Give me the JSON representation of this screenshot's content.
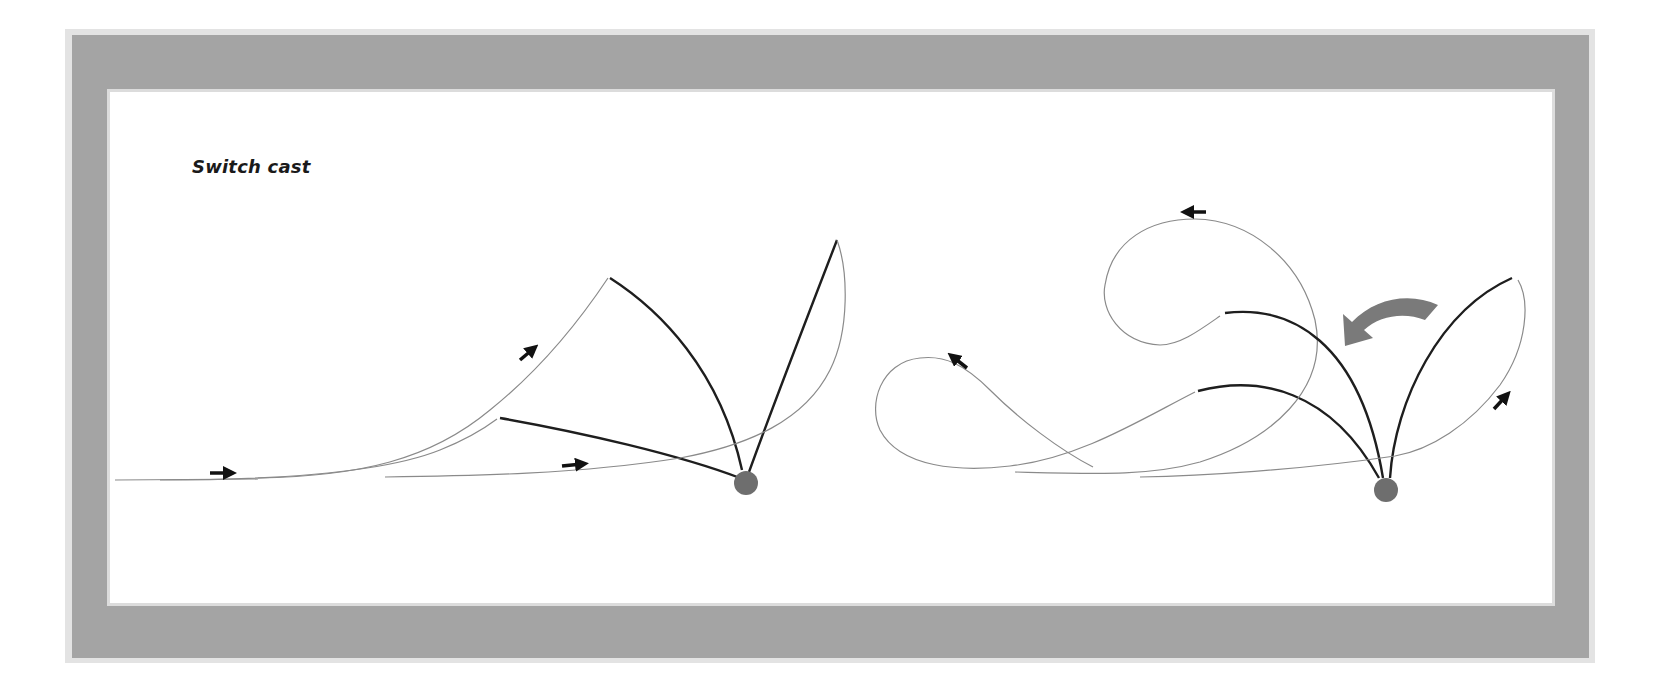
{
  "figure": {
    "title": "Switch cast",
    "colors": {
      "frame": "#a4a4a4",
      "frame_edge": "#e3e3e3",
      "background": "#ffffff",
      "line_thin": "#8a8a8a",
      "line_rod": "#1e1e1e",
      "ball": "#6e6e6e",
      "big_arrow": "#7a7a7a",
      "small_arrow": "#111111"
    },
    "panels": [
      {
        "name": "left-sequence",
        "description": "Line travels right along the water, lifts into a sidearm loop, rod swings back and forward",
        "arrows": [
          "right",
          "up-right",
          "right"
        ]
      },
      {
        "name": "right-sequence",
        "description": "Loops rolling out with rod sweeping forward; large curved arrow indicates switch direction",
        "arrows": [
          "up-left",
          "left",
          "up-right",
          "curved-left"
        ]
      }
    ]
  }
}
